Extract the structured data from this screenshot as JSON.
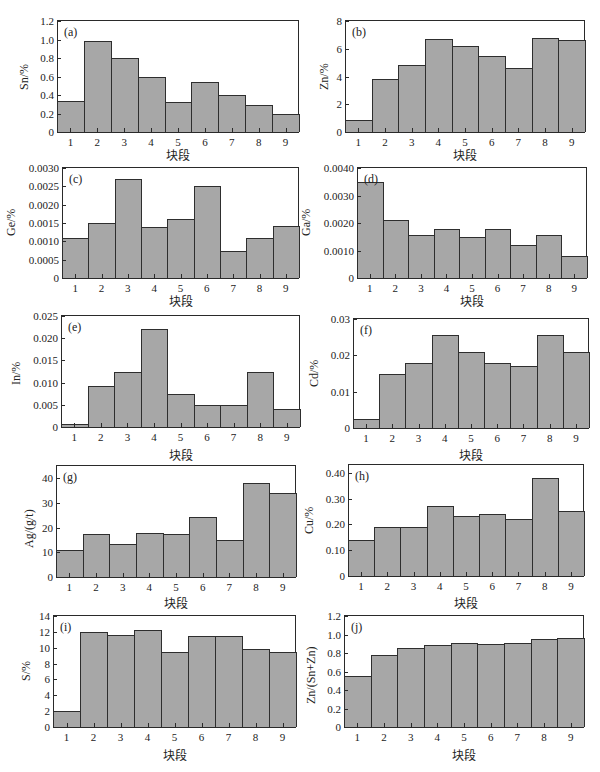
{
  "figure": {
    "xlabel": "块段"
  },
  "chart_data": [
    {
      "id": "a",
      "tag": "(a)",
      "type": "bar",
      "title": "",
      "xlabel": "块段",
      "ylabel": "Sn/%",
      "categories": [
        "1",
        "2",
        "3",
        "4",
        "5",
        "6",
        "7",
        "8",
        "9"
      ],
      "values": [
        0.33,
        0.98,
        0.8,
        0.6,
        0.32,
        0.54,
        0.4,
        0.29,
        0.2
      ],
      "ylim": [
        0,
        1.2
      ],
      "yticks": [
        "0",
        "0.2",
        "0.4",
        "0.6",
        "0.8",
        "1.0",
        "1.2"
      ],
      "ytick_values": [
        0,
        0.2,
        0.4,
        0.6,
        0.8,
        1.0,
        1.2
      ],
      "grid": false,
      "legend": "none"
    },
    {
      "id": "b",
      "tag": "(b)",
      "type": "bar",
      "title": "",
      "xlabel": "块段",
      "ylabel": "Zn/%",
      "categories": [
        "1",
        "2",
        "3",
        "4",
        "5",
        "6",
        "7",
        "8",
        "9"
      ],
      "values": [
        0.85,
        3.8,
        4.8,
        6.7,
        6.2,
        5.5,
        4.6,
        6.8,
        6.6
      ],
      "ylim": [
        0,
        8
      ],
      "yticks": [
        "0",
        "2",
        "4",
        "6",
        "8"
      ],
      "ytick_values": [
        0,
        2,
        4,
        6,
        8
      ],
      "grid": false,
      "legend": "none"
    },
    {
      "id": "c",
      "tag": "(c)",
      "type": "bar",
      "title": "",
      "xlabel": "块段",
      "ylabel": "Ge/%",
      "categories": [
        "1",
        "2",
        "3",
        "4",
        "5",
        "6",
        "7",
        "8",
        "9"
      ],
      "values": [
        0.0011,
        0.0015,
        0.0027,
        0.00138,
        0.0016,
        0.0025,
        0.00073,
        0.0011,
        0.00142
      ],
      "ylim": [
        0,
        0.003
      ],
      "yticks": [
        "0",
        "0.0005",
        "0.0010",
        "0.0015",
        "0.0020",
        "0.0025",
        "0.0030"
      ],
      "ytick_values": [
        0,
        0.0005,
        0.001,
        0.0015,
        0.002,
        0.0025,
        0.003
      ],
      "grid": false,
      "legend": "none"
    },
    {
      "id": "d",
      "tag": "(d)",
      "type": "bar",
      "title": "",
      "xlabel": "块段",
      "ylabel": "Ga/%",
      "categories": [
        "1",
        "2",
        "3",
        "4",
        "5",
        "6",
        "7",
        "8",
        "9"
      ],
      "values": [
        0.0035,
        0.0021,
        0.00155,
        0.0018,
        0.0015,
        0.0018,
        0.0012,
        0.00155,
        0.0008
      ],
      "ylim": [
        0,
        0.004
      ],
      "yticks": [
        "0",
        "0.0010",
        "0.0020",
        "0.0030",
        "0.0040"
      ],
      "ytick_values": [
        0,
        0.001,
        0.002,
        0.003,
        0.004
      ],
      "grid": false,
      "legend": "none"
    },
    {
      "id": "e",
      "tag": "(e)",
      "type": "bar",
      "title": "",
      "xlabel": "块段",
      "ylabel": "In/%",
      "categories": [
        "1",
        "2",
        "3",
        "4",
        "5",
        "6",
        "7",
        "8",
        "9"
      ],
      "values": [
        0.0007,
        0.0093,
        0.0125,
        0.022,
        0.0075,
        0.005,
        0.005,
        0.0125,
        0.004
      ],
      "ylim": [
        0,
        0.025
      ],
      "yticks": [
        "0",
        "0.005",
        "0.010",
        "0.015",
        "0.020",
        "0.025"
      ],
      "ytick_values": [
        0,
        0.005,
        0.01,
        0.015,
        0.02,
        0.025
      ],
      "grid": false,
      "legend": "none"
    },
    {
      "id": "f",
      "tag": "(f)",
      "type": "bar",
      "title": "",
      "xlabel": "块段",
      "ylabel": "Cd/%",
      "categories": [
        "1",
        "2",
        "3",
        "4",
        "5",
        "6",
        "7",
        "8",
        "9"
      ],
      "values": [
        0.0025,
        0.015,
        0.0178,
        0.0255,
        0.021,
        0.018,
        0.0172,
        0.0255,
        0.021
      ],
      "ylim": [
        0,
        0.03
      ],
      "yticks": [
        "0",
        "0.01",
        "0.02",
        "0.03"
      ],
      "ytick_values": [
        0,
        0.01,
        0.02,
        0.03
      ],
      "grid": false,
      "legend": "none"
    },
    {
      "id": "g",
      "tag": "(g)",
      "type": "bar",
      "title": "",
      "xlabel": "块段",
      "ylabel": "Ag/(g/t)",
      "categories": [
        "1",
        "2",
        "3",
        "4",
        "5",
        "6",
        "7",
        "8",
        "9"
      ],
      "values": [
        11,
        17.5,
        13.5,
        18,
        17.3,
        24.5,
        15,
        38,
        34
      ],
      "ylim": [
        0,
        45
      ],
      "yticks": [
        "0",
        "10",
        "20",
        "30",
        "40"
      ],
      "ytick_values": [
        0,
        10,
        20,
        30,
        40
      ],
      "grid": false,
      "legend": "none"
    },
    {
      "id": "h",
      "tag": "(h)",
      "type": "bar",
      "title": "",
      "xlabel": "块段",
      "ylabel": "Cu/%",
      "categories": [
        "1",
        "2",
        "3",
        "4",
        "5",
        "6",
        "7",
        "8",
        "9"
      ],
      "values": [
        0.14,
        0.19,
        0.188,
        0.27,
        0.232,
        0.24,
        0.222,
        0.378,
        0.25
      ],
      "ylim": [
        0,
        0.43
      ],
      "yticks": [
        "0",
        "0.10",
        "0.20",
        "0.30",
        "0.40"
      ],
      "ytick_values": [
        0,
        0.1,
        0.2,
        0.3,
        0.4
      ],
      "grid": false,
      "legend": "none"
    },
    {
      "id": "i",
      "tag": "(i)",
      "type": "bar",
      "title": "",
      "xlabel": "块段",
      "ylabel": "S/%",
      "categories": [
        "1",
        "2",
        "3",
        "4",
        "5",
        "6",
        "7",
        "8",
        "9"
      ],
      "values": [
        2.0,
        12.0,
        11.6,
        12.2,
        9.4,
        11.5,
        11.5,
        9.9,
        9.4
      ],
      "ylim": [
        0,
        14
      ],
      "yticks": [
        "0",
        "2",
        "4",
        "6",
        "8",
        "10",
        "12",
        "14"
      ],
      "ytick_values": [
        0,
        2,
        4,
        6,
        8,
        10,
        12,
        14
      ],
      "grid": false,
      "legend": "none"
    },
    {
      "id": "j",
      "tag": "(j)",
      "type": "bar",
      "title": "",
      "xlabel": "块段",
      "ylabel": "Zn/(Sn+Zn)",
      "categories": [
        "1",
        "2",
        "3",
        "4",
        "5",
        "6",
        "7",
        "8",
        "9"
      ],
      "values": [
        0.55,
        0.78,
        0.85,
        0.89,
        0.91,
        0.9,
        0.91,
        0.955,
        0.96
      ],
      "ylim": [
        0,
        1.2
      ],
      "yticks": [
        "0",
        "0.2",
        "0.4",
        "0.6",
        "0.8",
        "1.0",
        "1.2"
      ],
      "ytick_values": [
        0,
        0.2,
        0.4,
        0.6,
        0.8,
        1.0,
        1.2
      ],
      "grid": false,
      "legend": "none"
    }
  ],
  "colors": {
    "bar_fill": "#a7a7a7",
    "bar_edge": "#2e2e2e",
    "frame": "#2a2a2a",
    "background": "#ffffff"
  }
}
